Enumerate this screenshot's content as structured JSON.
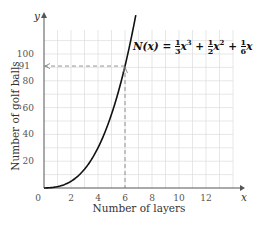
{
  "chart_data": {
    "type": "line",
    "title": "",
    "xlabel": "Number of layers",
    "ylabel": "Number of golf balls",
    "x_axis_symbol": "x",
    "y_axis_symbol": "y",
    "xlim": [
      0,
      14
    ],
    "ylim": [
      0,
      120
    ],
    "x_ticks": [
      0,
      2,
      4,
      6,
      8,
      10,
      12
    ],
    "y_ticks": [
      20,
      40,
      60,
      80,
      91,
      100
    ],
    "grid": true,
    "series": [
      {
        "name": "N(x) = 1/3 x^3 + 1/2 x^2 + 1/6 x",
        "function": "x^3/3 + x^2/2 + x/6",
        "x": [
          0,
          1,
          2,
          3,
          4,
          5,
          6,
          6.5
        ],
        "values": [
          0,
          1,
          5,
          14,
          30,
          55,
          91,
          114.2
        ]
      }
    ],
    "annotations": [
      {
        "type": "dashed-guide",
        "point": [
          6,
          91
        ],
        "label": "91"
      },
      {
        "type": "equation",
        "text": "N(x) = 1/3 x^3 + 1/2 x^2 + 1/6 x"
      }
    ]
  },
  "labels": {
    "x_axis_title": "Number of layers",
    "y_axis_title": "Number of golf balls",
    "x_symbol": "x",
    "y_symbol": "y",
    "highlight_value": "91",
    "formula_lhs": "N(x) =",
    "frac1_num": "1",
    "frac1_den": "3",
    "term1": "x",
    "exp1": "3",
    "plus1": "+",
    "frac2_num": "1",
    "frac2_den": "2",
    "term2": "x",
    "exp2": "2",
    "plus2": "+",
    "frac3_num": "1",
    "frac3_den": "6",
    "term3": "x"
  }
}
